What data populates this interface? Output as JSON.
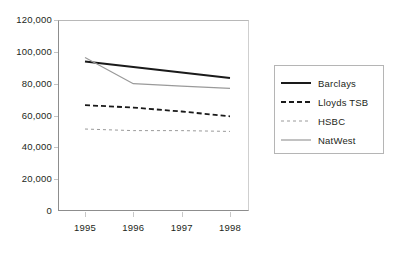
{
  "chart_data": {
    "type": "line",
    "title": "",
    "subtitle": "",
    "xlabel": "",
    "ylabel": "",
    "categories": [
      "1995",
      "1996",
      "1997",
      "1998"
    ],
    "x": [
      1995,
      1996,
      1997,
      1998
    ],
    "ylim": [
      0,
      120000
    ],
    "y_ticks": [
      0,
      20000,
      40000,
      60000,
      80000,
      100000,
      120000
    ],
    "y_tick_labels": [
      "0",
      "20,000",
      "40,000",
      "60,000",
      "80,000",
      "100,000",
      "120,000"
    ],
    "grid": false,
    "legend_position": "right",
    "series": [
      {
        "name": "Barclays",
        "values": [
          94000,
          90500,
          87000,
          83500
        ],
        "style": "solid",
        "color": "#1a1a1a",
        "width": 2.0
      },
      {
        "name": "Lloyds TSB",
        "values": [
          66500,
          65000,
          62500,
          59500
        ],
        "style": "dashed",
        "color": "#1a1a1a",
        "width": 1.8
      },
      {
        "name": "HSBC",
        "values": [
          51500,
          50500,
          50500,
          50000
        ],
        "style": "dashed",
        "color": "#9a9a9a",
        "width": 1.0
      },
      {
        "name": "NatWest",
        "values": [
          96500,
          80000,
          78500,
          77000
        ],
        "style": "solid",
        "color": "#9a9a9a",
        "width": 1.2
      }
    ]
  },
  "legend": {
    "items": [
      {
        "label": "Barclays",
        "icon": "solid-thick-line-icon"
      },
      {
        "label": "Lloyds TSB",
        "icon": "dashed-thick-line-icon"
      },
      {
        "label": "HSBC",
        "icon": "dashed-thin-line-icon"
      },
      {
        "label": "NatWest",
        "icon": "solid-thin-line-icon"
      }
    ]
  }
}
